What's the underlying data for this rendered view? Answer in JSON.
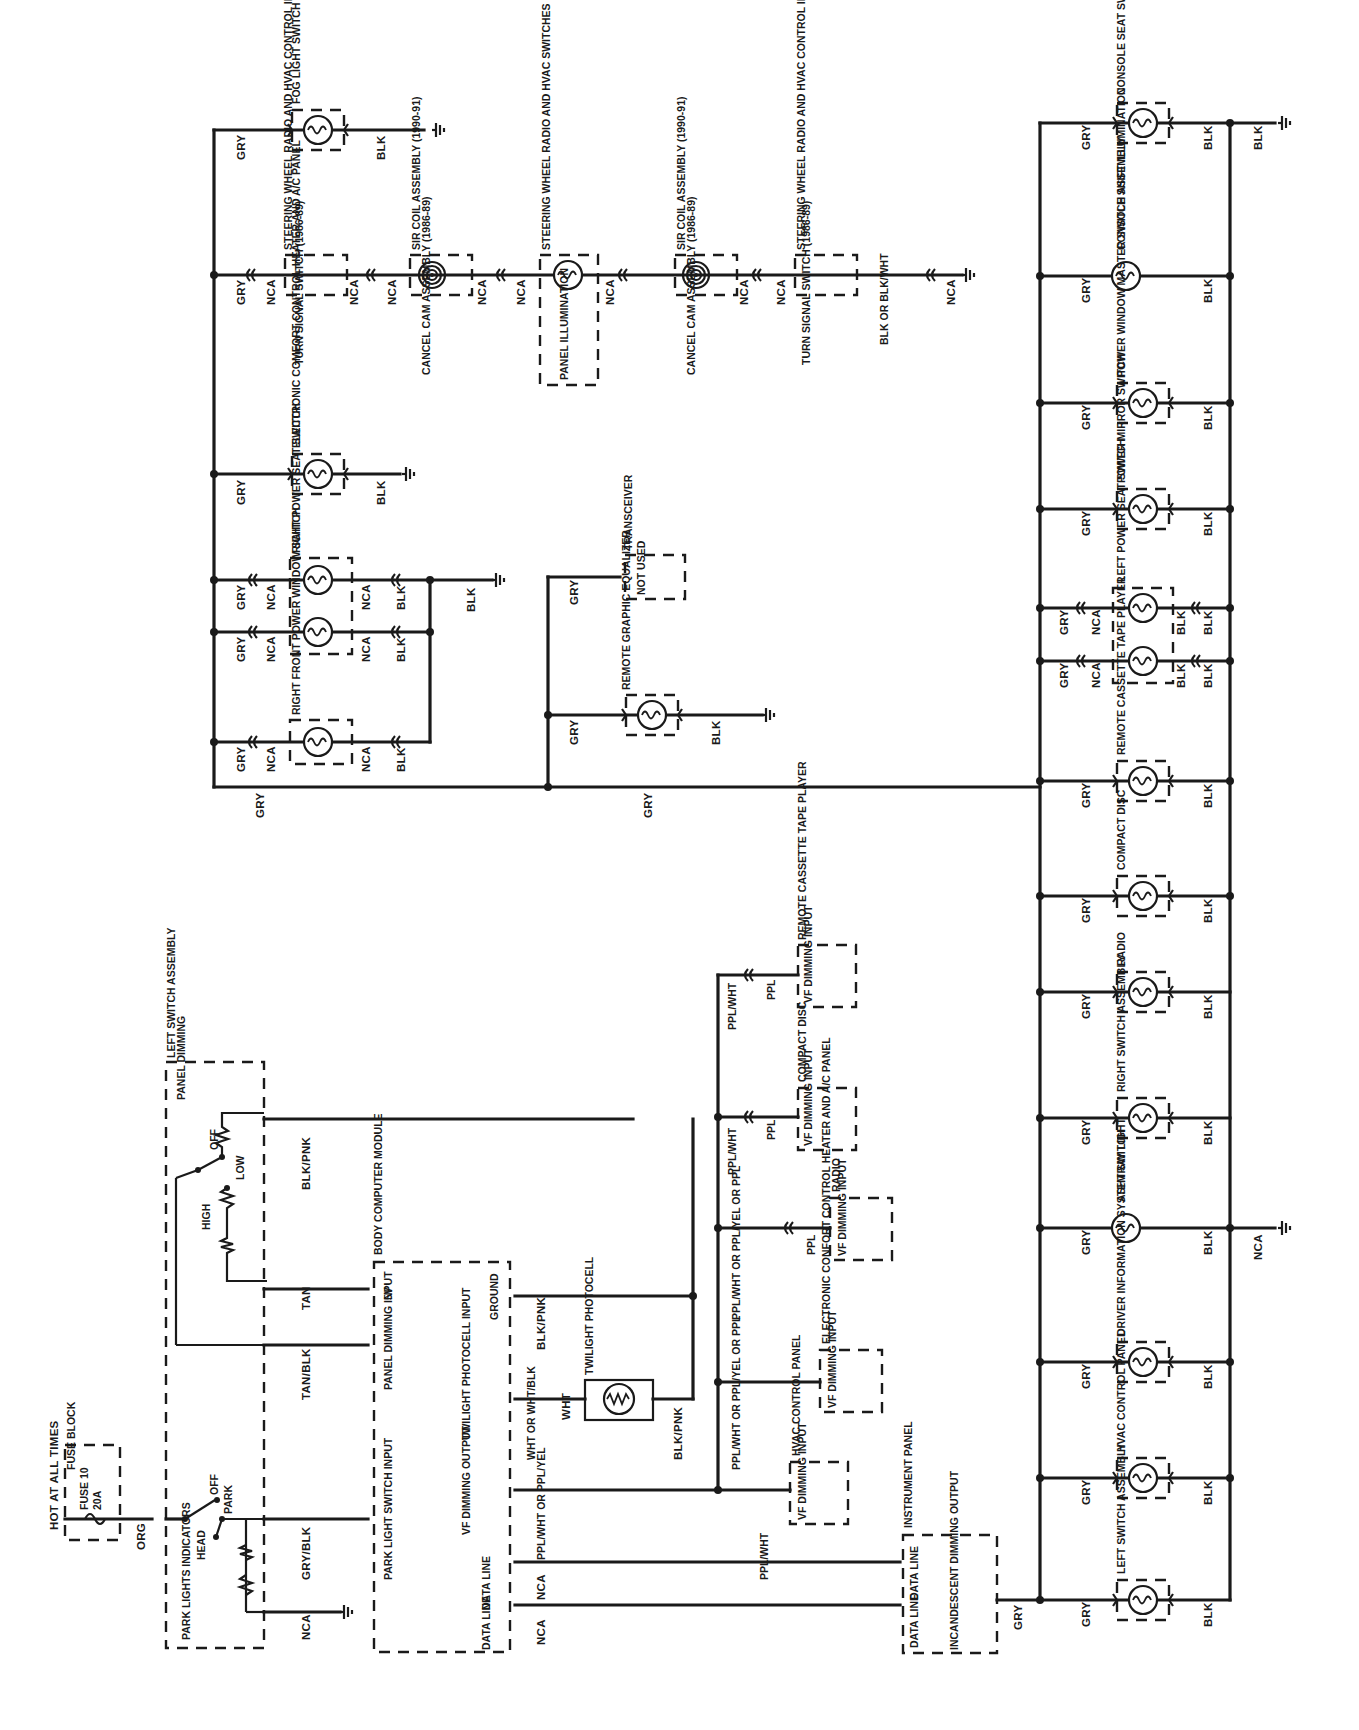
{
  "diagram": {
    "orientation": "rotated-90-ccw",
    "wire_colors": {
      "ORG": "ORG",
      "GRY": "GRY",
      "BLK": "BLK",
      "NCA": "NCA",
      "TAN": "TAN",
      "TAN_BLK": "TAN/BLK",
      "GRY_BLK": "GRY/BLK",
      "BLK_PNK": "BLK/PNK",
      "WHT": "WHT",
      "PPL": "PPL",
      "PPL_WHT": "PPL/WHT",
      "BLK_OR_BLK_WHT": "BLK OR BLK/WHT"
    },
    "power_source": {
      "hot_label": "HOT AT ALL TIMES",
      "fuse_block_label": "FUSE BLOCK",
      "fuse_label": "FUSE 10",
      "fuse_rating": "20A",
      "wire": "ORG"
    },
    "left_switch_assembly": {
      "title": "LEFT SWITCH ASSEMBLY",
      "headlamp_switch": {
        "positions": [
          "OFF",
          "PARK",
          "HEAD"
        ],
        "indicators_label": "PARK LIGHTS INDICATORS"
      },
      "panel_dimming": {
        "label": "PANEL DIMMING",
        "positions": [
          "OFF",
          "LOW",
          "HIGH"
        ]
      },
      "outputs": [
        {
          "wire": "BLK/PNK"
        },
        {
          "wire": "TAN"
        },
        {
          "wire": "TAN/BLK"
        },
        {
          "wire": "GRY/BLK"
        },
        {
          "wire": "NCA"
        }
      ]
    },
    "body_computer_module": {
      "title": "BODY COMPUTER MODULE",
      "pins": [
        {
          "label": "5V",
          "wire": "TAN"
        },
        {
          "label": "PANEL DIMMING INPUT",
          "wire": "TAN/BLK"
        },
        {
          "label": "PARK LIGHT SWITCH INPUT",
          "wire": "GRY/BLK"
        },
        {
          "label": "GROUND",
          "wire": "BLK/PNK"
        },
        {
          "label": "TWILIGHT PHOTOCELL INPUT",
          "wire": "WHT OR WHT/BLK"
        },
        {
          "label": "VF DIMMING OUTPUT",
          "wire": "PPL/WHT OR PPL/YEL"
        },
        {
          "label": "DATA LINE",
          "wire": "NCA"
        },
        {
          "label": "DATA LINE",
          "wire": "NCA"
        }
      ]
    },
    "twilight_photocell": {
      "label": "TWILIGHT PHOTOCELL",
      "wire_in": "WHT",
      "wire_out": "BLK/PNK"
    },
    "vf_dimming_branches": [
      {
        "component": "REMOTE CASSETTE TAPE PLAYER",
        "input": "VF DIMMING INPUT",
        "feed": "PPL/WHT",
        "wire": "PPL"
      },
      {
        "component": "COMPACT DISC",
        "input": "VF DIMMING INPUT",
        "feed": "PPL/WHT",
        "wire": "PPL"
      },
      {
        "component": "RADIO",
        "input": "VF DIMMING INPUT",
        "feed": "PPL/WHT OR PPL/YEL OR PPL",
        "wire": "PPL"
      },
      {
        "component": "ELECTRONIC CONFORT CONTROL HEATER AND A/C PANEL",
        "input": "VF DIMMING INPUT",
        "feed": "PPL/WHT OR PPL/YEL OR PPL",
        "wire": ""
      },
      {
        "component": "HVAC CONTROL PANEL",
        "input": "VF DIMMING INPUT",
        "feed": "PPL/WHT",
        "wire": ""
      }
    ],
    "instrument_panel": {
      "title": "INSTRUMENT PANEL",
      "pins": [
        "DATA LINE",
        "DATA LINE",
        "INCANDESCENT DIMMING OUTPUT"
      ],
      "output_wire": "GRY"
    },
    "upper_branch": {
      "bus_wire": "GRY",
      "fog_light_switch": {
        "label": "FOG LIGHT SWITCH",
        "in": "GRY",
        "out": "BLK"
      },
      "steering_chain": [
        {
          "label": "TURN SIGNAL SWITCH (1986-89)",
          "alt": "STEERING WHEEL RADIO AND HVAC CONTROL INTERFACE MODULE (1990-91)"
        },
        {
          "label": "CANCEL CAM ASSEMBLY (1986-89)",
          "alt": "SIR COIL ASSEMBLY (1990-91)"
        },
        {
          "label": "PANEL ILLUMINATION",
          "alt": "STEERING WHEEL RADIO AND HVAC SWITCHES"
        },
        {
          "label": "CANCEL CAM ASSEMBLY (1986-89)",
          "alt": "SIR COIL ASSEMBLY (1990-91)"
        },
        {
          "label": "TURN SIGNAL SWITCH (1986-89)",
          "alt": "STEERING WHEEL RADIO AND HVAC CONTROL INTERFACE MODULE (1990-91)"
        }
      ],
      "steering_chain_wires": [
        "GRY",
        "NCA",
        "NCA",
        "NCA",
        "NCA",
        "NCA",
        "NCA",
        "NCA",
        "NCA",
        "BLK OR BLK/WHT",
        "NCA"
      ],
      "ecc_panel": {
        "label": "ELECTRONIC COMFORT CONTROL HEATER AND A/C PANEL",
        "in": "GRY",
        "out": "BLK"
      },
      "right_power_seat_switch": {
        "label": "RIGHT POWER SEAT SWITCH",
        "wires": [
          "GRY",
          "NCA",
          "NCA",
          "BLK"
        ]
      },
      "right_front_power_window_switch": {
        "label": "RIGHT FRONT POWER WINDOW SWITCH",
        "wires": [
          "GRY",
          "NCA",
          "NCA",
          "BLK"
        ]
      },
      "ground_wire": "BLK",
      "transceiver": {
        "label": "TRANSCEIVER",
        "status": "NOT USED",
        "wire": "GRY"
      },
      "remote_graphic_equalizer": {
        "label": "REMOTE GRAPHIC EQUALIZER",
        "in": "GRY",
        "out": "BLK"
      }
    },
    "right_bus": {
      "feed_wire": "GRY",
      "return_wire": "BLK",
      "ground_wires": [
        "BLK",
        "NCA"
      ],
      "lamps": [
        {
          "label": "CONSOLE SEAT SWITCH",
          "in": "GRY",
          "out": "BLK"
        },
        {
          "label": "CONSOLE SHIFT ILLUMINATION",
          "in": "GRY",
          "out": "BLK"
        },
        {
          "label": "POWER WINDOW MASTER SWITCH ASSEMBLY",
          "in": "GRY",
          "out": "BLK"
        },
        {
          "label": "POWER MIRROR SWITCH",
          "in": "GRY",
          "out": "BLK"
        },
        {
          "label": "LEFT POWER SEAT SWITCH",
          "in": "GRY",
          "out": "BLK"
        },
        {
          "label": "",
          "in": "GRY",
          "out": "BLK"
        },
        {
          "label": "REMOTE CASSETTE TAPE PLAYER",
          "in": "GRY",
          "out": "BLK"
        },
        {
          "label": "COMPACT DISC",
          "in": "GRY",
          "out": "BLK"
        },
        {
          "label": "RADIO",
          "in": "GRY",
          "out": "BLK"
        },
        {
          "label": "RIGHT SWITCH ASSEMBLY",
          "in": "GRY",
          "out": "BLK"
        },
        {
          "label": "ASHTRAY LIGHT",
          "in": "GRY",
          "out": "BLK"
        },
        {
          "label": "DRIVER INFORMATION SYSTEM SWITCH",
          "in": "GRY",
          "out": "BLK"
        },
        {
          "label": "HVAC CONTROL PANEL",
          "in": "GRY",
          "out": "BLK"
        },
        {
          "label": "LEFT SWITCH ASSEMBLY",
          "in": "GRY",
          "out": "BLK"
        }
      ]
    }
  }
}
